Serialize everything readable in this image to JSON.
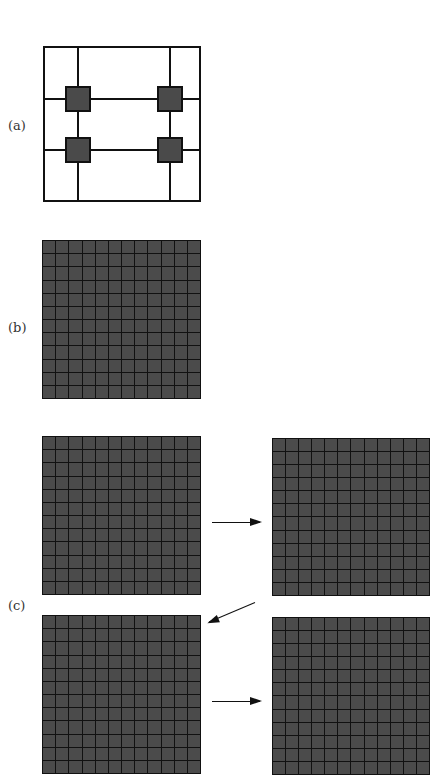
{
  "panels": {
    "a": {
      "label": "(a)"
    },
    "b": {
      "label": "(b)",
      "rows": 12,
      "cols": 12
    },
    "c": {
      "label": "(c)",
      "rows": 12,
      "cols": 12
    }
  },
  "colors": {
    "line": "#111111",
    "cell_fill": "#4b4b4b",
    "node_fill": "#4a4a4a",
    "background": "#ffffff"
  }
}
